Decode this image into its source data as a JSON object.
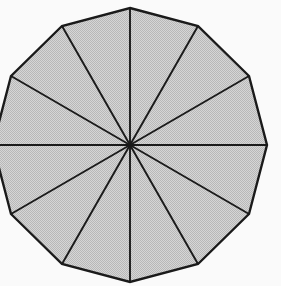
{
  "figure": {
    "shape_name": "dodecagon",
    "canvas": {
      "width": 281,
      "height": 286,
      "background_color": "#fafafa"
    },
    "geometry": {
      "sides": 12,
      "spokes": 12,
      "center_x": 130,
      "center_y": 145,
      "circumradius": 137,
      "start_angle_deg": -90,
      "clipped_edges": [
        "left",
        "bottom",
        "top"
      ]
    },
    "style": {
      "fill_color": "#c9c9c9",
      "dither_light": "#d8d8d8",
      "dither_dark": "#b4b4b4",
      "stroke_color": "#1a1a1a",
      "outline_width": 2.4,
      "spoke_width": 1.9
    },
    "vertices": [
      {
        "index": 1,
        "angle_deg": -90,
        "x": 130,
        "y": 8
      },
      {
        "index": 2,
        "angle_deg": -60,
        "x": 198,
        "y": 26
      },
      {
        "index": 3,
        "angle_deg": -30,
        "x": 249,
        "y": 76
      },
      {
        "index": 4,
        "angle_deg": 0,
        "x": 267,
        "y": 145
      },
      {
        "index": 5,
        "angle_deg": 30,
        "x": 249,
        "y": 214
      },
      {
        "index": 6,
        "angle_deg": 60,
        "x": 198,
        "y": 264
      },
      {
        "index": 7,
        "angle_deg": 90,
        "x": 130,
        "y": 282
      },
      {
        "index": 8,
        "angle_deg": 120,
        "x": 62,
        "y": 264
      },
      {
        "index": 9,
        "angle_deg": 150,
        "x": 11,
        "y": 214
      },
      {
        "index": 10,
        "angle_deg": 180,
        "x": -7,
        "y": 145
      },
      {
        "index": 11,
        "angle_deg": 210,
        "x": 11,
        "y": 76
      },
      {
        "index": 12,
        "angle_deg": 240,
        "x": 62,
        "y": 26
      }
    ]
  }
}
